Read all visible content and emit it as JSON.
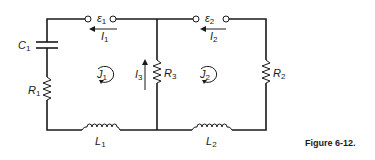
{
  "figure": {
    "caption": "Figure 6-12.",
    "components": {
      "emf1": {
        "symbol": "ε",
        "sub": "1"
      },
      "emf2": {
        "symbol": "ε",
        "sub": "2"
      },
      "c1": {
        "symbol": "C",
        "sub": "1"
      },
      "r1": {
        "symbol": "R",
        "sub": "1"
      },
      "r2": {
        "symbol": "R",
        "sub": "2"
      },
      "r3": {
        "symbol": "R",
        "sub": "3"
      },
      "l1": {
        "symbol": "L",
        "sub": "1"
      },
      "l2": {
        "symbol": "L",
        "sub": "2"
      }
    },
    "currents": {
      "i1": {
        "symbol": "I",
        "sub": "1"
      },
      "i2": {
        "symbol": "I",
        "sub": "2"
      },
      "i3": {
        "symbol": "I",
        "sub": "3"
      }
    },
    "loops": {
      "j1": {
        "symbol": "J",
        "sub": "1"
      },
      "j2": {
        "symbol": "J",
        "sub": "2"
      }
    }
  }
}
